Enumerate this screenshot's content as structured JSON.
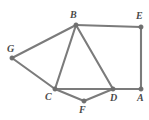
{
  "diagram": {
    "type": "node-link-diagram",
    "canvas": {
      "width": 149,
      "height": 120,
      "background": "#ffffff"
    },
    "style": {
      "edge_color": "#7b7b7b",
      "edge_width": 2.1,
      "vertex_color": "#6f6f6f",
      "vertex_radius": 2.2,
      "label_color": "#4a4a4a",
      "label_font_size": 10
    },
    "vertices": [
      {
        "id": "A",
        "label": "A",
        "x": 141,
        "y": 89,
        "label_x": 137,
        "label_y": 93
      },
      {
        "id": "B",
        "label": "B",
        "x": 76,
        "y": 25,
        "label_x": 70,
        "label_y": 10
      },
      {
        "id": "C",
        "label": "C",
        "x": 55,
        "y": 89,
        "label_x": 45,
        "label_y": 92
      },
      {
        "id": "D",
        "label": "D",
        "x": 113,
        "y": 89,
        "label_x": 110,
        "label_y": 93
      },
      {
        "id": "E",
        "label": "E",
        "x": 141,
        "y": 27,
        "label_x": 136,
        "label_y": 11
      },
      {
        "id": "F",
        "label": "F",
        "x": 84,
        "y": 101,
        "label_x": 79,
        "label_y": 105
      },
      {
        "id": "G",
        "label": "G",
        "x": 12,
        "y": 58,
        "label_x": 7,
        "label_y": 44
      }
    ],
    "edges": [
      {
        "id": "edge-B-E",
        "from": "B",
        "to": "E",
        "x1": 76,
        "y1": 25,
        "x2": 141,
        "y2": 27
      },
      {
        "id": "edge-B-G",
        "from": "B",
        "to": "G",
        "x1": 76,
        "y1": 25,
        "x2": 12,
        "y2": 58
      },
      {
        "id": "edge-B-C",
        "from": "B",
        "to": "C",
        "x1": 76,
        "y1": 25,
        "x2": 55,
        "y2": 89
      },
      {
        "id": "edge-B-D",
        "from": "B",
        "to": "D",
        "x1": 76,
        "y1": 25,
        "x2": 113,
        "y2": 89
      },
      {
        "id": "edge-G-C",
        "from": "G",
        "to": "C",
        "x1": 12,
        "y1": 58,
        "x2": 55,
        "y2": 89
      },
      {
        "id": "edge-C-D",
        "from": "C",
        "to": "D",
        "x1": 55,
        "y1": 89,
        "x2": 113,
        "y2": 89
      },
      {
        "id": "edge-C-F",
        "from": "C",
        "to": "F",
        "x1": 55,
        "y1": 89,
        "x2": 84,
        "y2": 101
      },
      {
        "id": "edge-F-D",
        "from": "F",
        "to": "D",
        "x1": 84,
        "y1": 101,
        "x2": 113,
        "y2": 89
      },
      {
        "id": "edge-D-A",
        "from": "D",
        "to": "A",
        "x1": 113,
        "y1": 89,
        "x2": 141,
        "y2": 89
      },
      {
        "id": "edge-E-A",
        "from": "E",
        "to": "A",
        "x1": 141,
        "y1": 27,
        "x2": 141,
        "y2": 89
      }
    ]
  }
}
